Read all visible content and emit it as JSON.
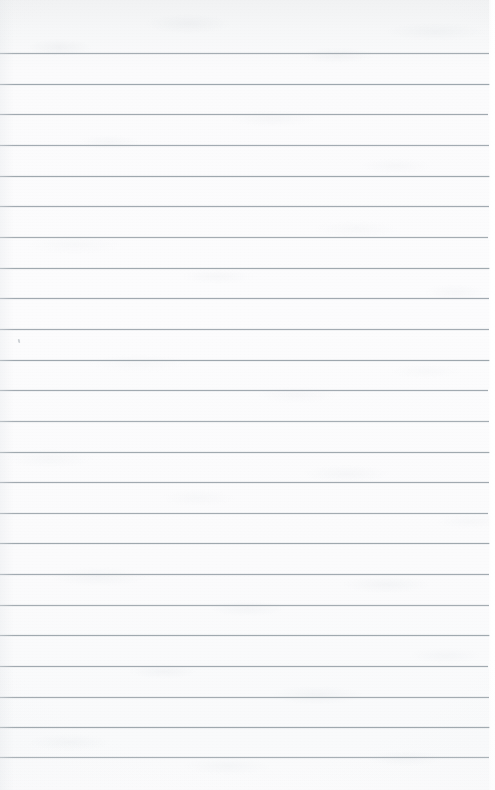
{
  "document": {
    "kind": "lined-notebook-paper-scan",
    "title": "Blank Ruled Notebook Page",
    "width_px": 495,
    "height_px": 790,
    "text_content": "",
    "has_handwriting": false,
    "has_printed_text": false,
    "has_margin_rule": false,
    "has_hole_punches": false
  },
  "paper": {
    "background_color": "#fbfbfc",
    "top_margin_tint": "#f1f2f3",
    "texture": "mottled scan grain",
    "right_edge_strip_color": "#ffffff"
  },
  "ruling": {
    "style": "wide-ruled horizontal lines",
    "line_color": "#9aa3aa",
    "line_thickness_px": 1,
    "line_spacing_px": 30.65,
    "line_count": 24,
    "first_line_y": 53,
    "last_line_y": 757,
    "line_start_x": 0,
    "line_end_x": 489,
    "top_margin_px": 53,
    "bottom_margin_px": 33,
    "line_y_positions": [
      53,
      83.7,
      114.3,
      145,
      175.6,
      206.3,
      236.9,
      267.6,
      298.2,
      328.9,
      359.5,
      390.2,
      420.8,
      451.5,
      482.1,
      512.8,
      543.4,
      574.1,
      604.7,
      635.4,
      666,
      696.7,
      727.3,
      757
    ],
    "line_widths": [
      489,
      490,
      488,
      489,
      490,
      489,
      488,
      490,
      489,
      489,
      490,
      488,
      489,
      490,
      489,
      488,
      490,
      489,
      489,
      490,
      488,
      489,
      490,
      489
    ],
    "line_opacities": [
      0.88,
      0.95,
      0.92,
      0.9,
      0.94,
      0.91,
      0.89,
      0.93,
      0.92,
      0.9,
      0.95,
      0.91,
      0.88,
      0.93,
      0.92,
      0.9,
      0.94,
      0.91,
      0.89,
      0.93,
      0.92,
      0.9,
      0.94,
      0.86
    ]
  },
  "artifacts": [
    {
      "name": "dust-speck",
      "x": 18,
      "y": 339
    }
  ]
}
